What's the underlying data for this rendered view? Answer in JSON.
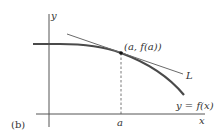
{
  "figure": {
    "panel_label": "(b)",
    "axes": {
      "x_label": "x",
      "y_label": "y"
    },
    "point_label": "(a, f(a))",
    "tangent_label": "L",
    "curve_label": "y = f(x)",
    "tick_label": "a"
  },
  "colors": {
    "axis": "#555555",
    "curve": "#4a4a4a",
    "tangent": "#6a6a6a",
    "text": "#333333"
  }
}
